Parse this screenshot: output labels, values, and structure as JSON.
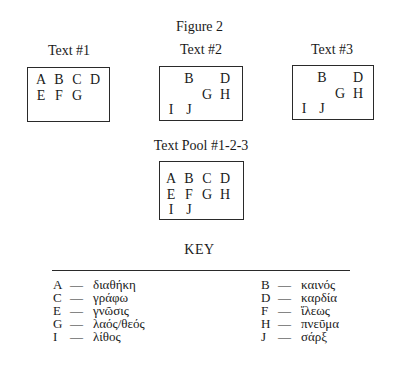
{
  "figure_title": "Figure 2",
  "texts": [
    {
      "label": "Text #1",
      "letters": [
        {
          "char": "A",
          "row": 0,
          "col": 0
        },
        {
          "char": "B",
          "row": 0,
          "col": 1
        },
        {
          "char": "C",
          "row": 0,
          "col": 2
        },
        {
          "char": "D",
          "row": 0,
          "col": 3
        },
        {
          "char": "E",
          "row": 1,
          "col": 0
        },
        {
          "char": "F",
          "row": 1,
          "col": 1
        },
        {
          "char": "G",
          "row": 1,
          "col": 2
        }
      ]
    },
    {
      "label": "Text #2",
      "letters": [
        {
          "char": "B",
          "row": 0,
          "col": 1
        },
        {
          "char": "D",
          "row": 0,
          "col": 3
        },
        {
          "char": "G",
          "row": 1,
          "col": 2
        },
        {
          "char": "H",
          "row": 1,
          "col": 3
        },
        {
          "char": "I",
          "row": 2,
          "col": 0
        },
        {
          "char": "J",
          "row": 2,
          "col": 1
        }
      ]
    },
    {
      "label": "Text #3",
      "letters": [
        {
          "char": "B",
          "row": 0,
          "col": 1
        },
        {
          "char": "D",
          "row": 0,
          "col": 3
        },
        {
          "char": "G",
          "row": 1,
          "col": 2
        },
        {
          "char": "H",
          "row": 1,
          "col": 3
        },
        {
          "char": "I",
          "row": 2,
          "col": 0
        },
        {
          "char": "J",
          "row": 2,
          "col": 1
        }
      ]
    }
  ],
  "pool": {
    "label": "Text Pool #1-2-3",
    "letters": [
      {
        "char": "A",
        "row": 0,
        "col": 0
      },
      {
        "char": "B",
        "row": 0,
        "col": 1
      },
      {
        "char": "C",
        "row": 0,
        "col": 2
      },
      {
        "char": "D",
        "row": 0,
        "col": 3
      },
      {
        "char": "E",
        "row": 1,
        "col": 0
      },
      {
        "char": "F",
        "row": 1,
        "col": 1
      },
      {
        "char": "G",
        "row": 1,
        "col": 2
      },
      {
        "char": "H",
        "row": 1,
        "col": 3
      },
      {
        "char": "I",
        "row": 2,
        "col": 0
      },
      {
        "char": "J",
        "row": 2,
        "col": 1
      }
    ]
  },
  "key": {
    "title": "KEY",
    "dash": "—",
    "left": [
      {
        "letter": "A",
        "word": "διαθήκη"
      },
      {
        "letter": "C",
        "word": "γράφω"
      },
      {
        "letter": "E",
        "word": "γνῶσις"
      },
      {
        "letter": "G",
        "word": "λαός/θεός"
      },
      {
        "letter": "I",
        "word": "λίθος"
      }
    ],
    "right": [
      {
        "letter": "B",
        "word": "καινός"
      },
      {
        "letter": "D",
        "word": "καρδία"
      },
      {
        "letter": "F",
        "word": "ἵλεως"
      },
      {
        "letter": "H",
        "word": "πνεῦμα"
      },
      {
        "letter": "J",
        "word": "σάρξ"
      }
    ]
  }
}
